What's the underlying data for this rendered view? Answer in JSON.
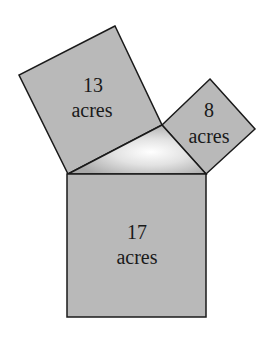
{
  "figure": {
    "colors": {
      "square_fill": "#b9b9b9",
      "stroke": "#1a1a1a",
      "triangle_center": "#ffffff",
      "triangle_edge": "#a8a8a8",
      "background": "#ffffff"
    },
    "squares": [
      {
        "id": "upper-left",
        "number": "13",
        "unit": "acres"
      },
      {
        "id": "upper-right",
        "number": "8",
        "unit": "acres"
      },
      {
        "id": "bottom",
        "number": "17",
        "unit": "acres"
      }
    ]
  }
}
